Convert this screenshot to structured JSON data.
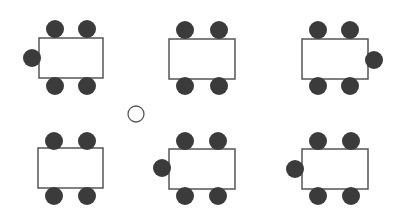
{
  "diagram": {
    "width": 402,
    "height": 223,
    "colors": {
      "background": "#ffffff",
      "table_stroke": "#555555",
      "chair_fill": "#3b3b3b"
    },
    "chair_radius": 9,
    "tables": [
      {
        "id": "table-1",
        "x": 39,
        "y": 38,
        "w": 64,
        "h": 40,
        "chairs": [
          [
            55,
            29
          ],
          [
            87,
            29
          ],
          [
            55,
            86
          ],
          [
            87,
            86
          ],
          [
            32,
            58
          ]
        ]
      },
      {
        "id": "table-2",
        "x": 169,
        "y": 39,
        "w": 66,
        "h": 40,
        "chairs": [
          [
            185,
            30
          ],
          [
            219,
            30
          ],
          [
            185,
            86
          ],
          [
            219,
            86
          ]
        ]
      },
      {
        "id": "table-3",
        "x": 302,
        "y": 39,
        "w": 66,
        "h": 40,
        "chairs": [
          [
            318,
            30
          ],
          [
            350,
            30
          ],
          [
            318,
            86
          ],
          [
            350,
            86
          ],
          [
            374,
            60
          ]
        ]
      },
      {
        "id": "table-4",
        "x": 38,
        "y": 148,
        "w": 65,
        "h": 40,
        "chairs": [
          [
            54,
            141
          ],
          [
            87,
            141
          ],
          [
            54,
            196
          ],
          [
            87,
            196
          ]
        ]
      },
      {
        "id": "table-5",
        "x": 169,
        "y": 149,
        "w": 66,
        "h": 40,
        "chairs": [
          [
            185,
            141
          ],
          [
            218,
            141
          ],
          [
            185,
            196
          ],
          [
            218,
            196
          ],
          [
            162,
            168
          ]
        ]
      },
      {
        "id": "table-6",
        "x": 302,
        "y": 149,
        "w": 66,
        "h": 40,
        "chairs": [
          [
            318,
            141
          ],
          [
            351,
            141
          ],
          [
            318,
            196
          ],
          [
            351,
            196
          ],
          [
            295,
            169
          ]
        ]
      }
    ],
    "empty_seat": {
      "cx": 136,
      "cy": 114,
      "r": 8
    }
  }
}
